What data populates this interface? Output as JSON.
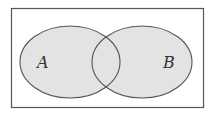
{
  "diagram": {
    "type": "venn",
    "universe": {
      "x": 11,
      "y": 8,
      "width": 193,
      "height": 100,
      "stroke": "#555555"
    },
    "sets": [
      {
        "label": "A",
        "cx": 70,
        "cy": 62,
        "rx": 50,
        "ry": 36,
        "label_x": 43,
        "label_y": 68
      },
      {
        "label": "B",
        "cx": 142,
        "cy": 62,
        "rx": 50,
        "ry": 36,
        "label_x": 168,
        "label_y": 68
      }
    ],
    "fill": "#e3e3e3",
    "stroke": "#555555"
  }
}
